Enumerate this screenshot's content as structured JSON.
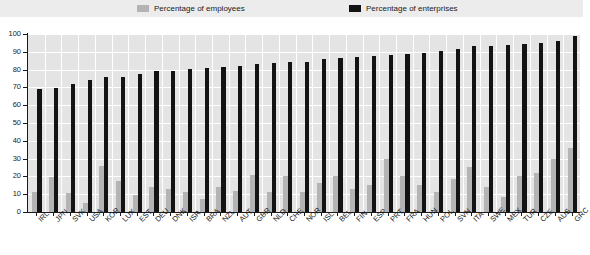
{
  "legend": {
    "employees": {
      "label": "Percentage of employees",
      "color": "#b4b4b4",
      "icon": "legend-swatch-icon"
    },
    "enterprises": {
      "label": "Percentage of enterprises",
      "color": "#131313",
      "icon": "legend-swatch-icon"
    }
  },
  "chart_data": {
    "type": "bar",
    "title": "",
    "xlabel": "",
    "ylabel": "",
    "ylim": [
      0,
      100
    ],
    "yticks": [
      0,
      10,
      20,
      30,
      40,
      50,
      60,
      70,
      80,
      90,
      100
    ],
    "ytick_labels": [
      "0",
      "10",
      "20",
      "30",
      "40",
      "50",
      "60",
      "70",
      "80",
      "90",
      "100"
    ],
    "grid": true,
    "legend_position": "top",
    "categories": [
      "IRL",
      "JPN",
      "SVK",
      "USA",
      "KOR",
      "LUX",
      "EST",
      "DEU",
      "DNK",
      "ISR",
      "BRA",
      "NZL",
      "AUT",
      "GBR",
      "NLD",
      "CHE",
      "NOR",
      "ISL",
      "BEL",
      "FIN",
      "ESP",
      "PRT",
      "FRA",
      "HUN",
      "POL",
      "SVN",
      "ITA",
      "SWE",
      "MEX",
      "TUR",
      "CZE",
      "AUS",
      "GRC"
    ],
    "series": [
      {
        "name": "Percentage of employees",
        "color": "#b4b4b4",
        "values": [
          11,
          19.5,
          10.5,
          5,
          26,
          17.5,
          9.5,
          14,
          13,
          11.5,
          7.5,
          14,
          12,
          21,
          11.5,
          20,
          11,
          16.5,
          20.5,
          13,
          15,
          30,
          20.5,
          15,
          11,
          18.5,
          25.5,
          14,
          8.5,
          20,
          22,
          30,
          36
        ]
      },
      {
        "name": "Percentage of enterprises",
        "color": "#131313",
        "values": [
          69,
          69.5,
          72,
          74,
          76,
          76,
          77.5,
          79,
          79.5,
          80.5,
          81,
          81.5,
          82,
          83,
          83.5,
          84,
          84.5,
          86,
          86.5,
          87,
          87.5,
          88,
          89,
          89.5,
          90.5,
          91.5,
          93,
          93.5,
          94,
          94.5,
          95,
          96,
          99
        ]
      }
    ]
  }
}
